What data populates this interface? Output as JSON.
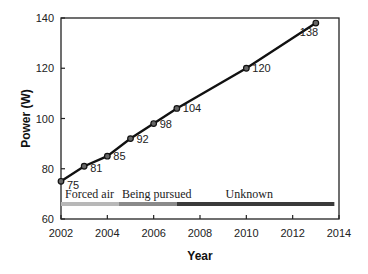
{
  "chart_data": {
    "type": "line",
    "title": "",
    "xlabel": "Year",
    "ylabel": "Power (W)",
    "xlim": [
      2002,
      2014
    ],
    "ylim": [
      60,
      140
    ],
    "xticks": [
      2002,
      2004,
      2006,
      2008,
      2010,
      2012,
      2014
    ],
    "yticks": [
      60,
      80,
      100,
      120,
      140
    ],
    "grid": false,
    "legend": null,
    "series": [
      {
        "name": "Power",
        "color": "#111111",
        "marker": "circle",
        "x": [
          2002,
          2003,
          2004,
          2005,
          2006,
          2007,
          2010,
          2013
        ],
        "values": [
          75,
          81,
          85,
          92,
          98,
          104,
          120,
          138
        ],
        "labels": [
          "75",
          "81",
          "85",
          "92",
          "98",
          "104",
          "120",
          "138"
        ]
      }
    ],
    "annotations": [
      {
        "text": "Forced air",
        "x_start": 2002,
        "x_end": 2004.5,
        "color": "#b8b8b8"
      },
      {
        "text": "Being pursued",
        "x_start": 2004.5,
        "x_end": 2007,
        "color": "#8a8a8a"
      },
      {
        "text": "Unknown",
        "x_start": 2007,
        "x_end": 2013.8,
        "color": "#3a3a3a"
      }
    ],
    "band_y": 66
  }
}
